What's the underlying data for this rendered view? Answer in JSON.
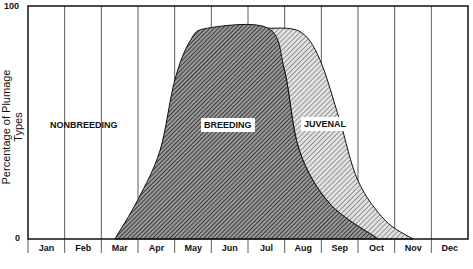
{
  "chart_data": {
    "type": "area",
    "title": "",
    "xlabel": "",
    "ylabel": "Percentage of Plumage Types",
    "ylim": [
      0,
      100
    ],
    "yticks": [
      0,
      100
    ],
    "categories": [
      "Jan",
      "Feb",
      "Mar",
      "Apr",
      "May",
      "Jun",
      "Jul",
      "Aug",
      "Sep",
      "Oct",
      "Nov",
      "Dec"
    ],
    "grid": "vertical month dividers",
    "series": [
      {
        "name": "BREEDING",
        "pattern": "dense diagonal hatch (dark)",
        "points_month_pct": [
          [
            2.37,
            0
          ],
          [
            3.0,
            17
          ],
          [
            3.6,
            38
          ],
          [
            4.0,
            68
          ],
          [
            4.42,
            85
          ],
          [
            4.9,
            90.5
          ],
          [
            6.55,
            90.5
          ],
          [
            7.0,
            72
          ],
          [
            7.4,
            38
          ],
          [
            8.24,
            15
          ],
          [
            9.55,
            0
          ]
        ]
      },
      {
        "name": "JUVENAL",
        "pattern": "light diagonal hatch",
        "points_month_pct": [
          [
            6.55,
            90.5
          ],
          [
            7.42,
            89
          ],
          [
            7.96,
            77
          ],
          [
            8.5,
            51
          ],
          [
            9.0,
            25
          ],
          [
            9.74,
            8
          ],
          [
            10.5,
            0
          ]
        ]
      },
      {
        "name": "NONBREEDING",
        "pattern": "none (white, remainder)"
      }
    ],
    "annotations": [
      "NONBREEDING",
      "BREEDING",
      "JUVENAL"
    ]
  },
  "axis": {
    "ylabel": "Percentage of Plumage Types",
    "y_top": "100",
    "y_bottom": "0",
    "months": [
      "Jan",
      "Feb",
      "Mar",
      "Apr",
      "May",
      "Jun",
      "Jul",
      "Aug",
      "Sep",
      "Oct",
      "Nov",
      "Dec"
    ]
  },
  "labels": {
    "nonbreeding": "NONBREEDING",
    "breeding": "BREEDING",
    "juvenal": "JUVENAL"
  }
}
